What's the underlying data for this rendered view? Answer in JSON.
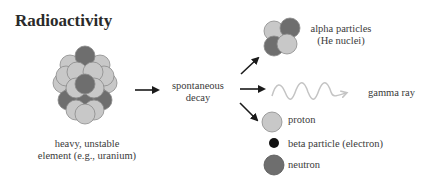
{
  "title": "Radioactivity",
  "source": {
    "label_line1": "heavy, unstable",
    "label_line2": "element (e.g., uranium)"
  },
  "process": {
    "label_line1": "spontaneous",
    "label_line2": "decay"
  },
  "products": {
    "alpha": {
      "line1": "alpha particles",
      "line2": "(He nuclei)"
    },
    "gamma": {
      "label": "gamma ray"
    }
  },
  "legend": {
    "items": [
      {
        "label": "proton",
        "color": "#c8c8c8"
      },
      {
        "label": "beta particle (electron)",
        "color": "#111111"
      },
      {
        "label": "neutron",
        "color": "#6e6e6e"
      }
    ]
  },
  "colors": {
    "proton": "#c8c8c8",
    "neutron": "#6e6e6e",
    "electron": "#111111",
    "gamma_wave": "#c4c4c4",
    "arrow": "#1a1a1a"
  }
}
